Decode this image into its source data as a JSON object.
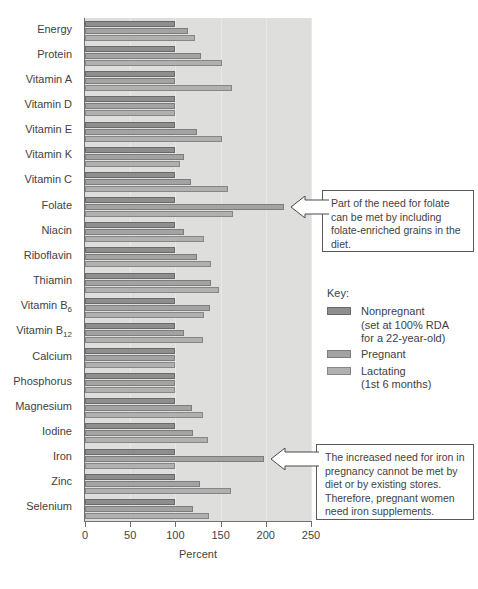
{
  "chart_data": {
    "type": "bar",
    "orientation": "horizontal",
    "title": "",
    "xlabel": "Percent",
    "ylabel": "",
    "xlim": [
      0,
      250
    ],
    "xticks": [
      0,
      50,
      100,
      150,
      200,
      250
    ],
    "grid": true,
    "grid_axis": "x",
    "legend_position": "right",
    "categories": [
      "Energy",
      "Protein",
      "Vitamin A",
      "Vitamin D",
      "Vitamin E",
      "Vitamin K",
      "Vitamin C",
      "Folate",
      "Niacin",
      "Riboflavin",
      "Thiamin",
      "Vitamin B6",
      "Vitamin B12",
      "Calcium",
      "Phosphorus",
      "Magnesium",
      "Iodine",
      "Iron",
      "Zinc",
      "Selenium"
    ],
    "series": [
      {
        "name": "Nonpregnant",
        "note": "set at 100% RDA for a 22-year-old",
        "color": "#8e8e8e",
        "values": [
          100,
          100,
          100,
          100,
          100,
          100,
          100,
          100,
          100,
          100,
          100,
          100,
          100,
          100,
          100,
          100,
          100,
          100,
          100,
          100
        ]
      },
      {
        "name": "Pregnant",
        "color": "#a3a3a3",
        "values": [
          114,
          128,
          100,
          100,
          124,
          109,
          117,
          220,
          109,
          124,
          139,
          138,
          109,
          100,
          100,
          118,
          120,
          198,
          127,
          119
        ]
      },
      {
        "name": "Lactating",
        "note": "1st 6 months",
        "color": "#b0b0b0",
        "values": [
          122,
          152,
          163,
          100,
          152,
          105,
          158,
          164,
          132,
          139,
          148,
          132,
          130,
          100,
          100,
          131,
          136,
          100,
          161,
          137
        ]
      }
    ]
  },
  "axis": {
    "tick_labels": [
      "0",
      "50",
      "100",
      "150",
      "200",
      "250"
    ],
    "x_axis_title": "Percent"
  },
  "legend": {
    "title": "Key:",
    "entries": [
      {
        "label": "Nonpregnant",
        "sub1": "(set at 100% RDA",
        "sub2": "for a 22-year-old)"
      },
      {
        "label": "Pregnant",
        "sub1": "",
        "sub2": ""
      },
      {
        "label": "Lactating",
        "sub1": "(1st 6 months)",
        "sub2": ""
      }
    ]
  },
  "callouts": [
    {
      "id": "folate",
      "text": "Part of the need for folate can be met by including folate-enriched grains in the diet.",
      "points_to": "Folate"
    },
    {
      "id": "iron",
      "text": "The increased need for iron in pregnancy cannot be met by diet or by existing stores. Therefore, pregnant women need iron supplements.",
      "points_to": "Iron"
    }
  ],
  "colors": {
    "plot_background": "#dededc",
    "axis": "#6f6f6f",
    "gridline": "#e9e9e7",
    "text": "#3f3f3f",
    "callout_border": "#5a5a5a"
  }
}
